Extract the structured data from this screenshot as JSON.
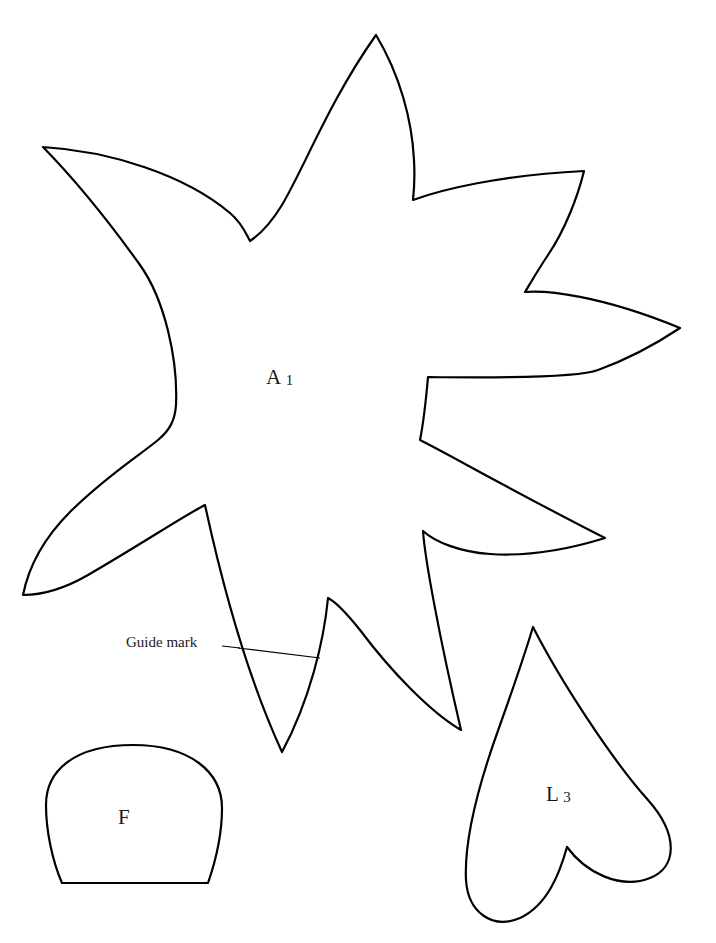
{
  "document": {
    "title": "Pattern Template Sheet",
    "background_color": "#ffffff",
    "stroke_color": "#000000",
    "page_width": 716,
    "page_height": 943
  },
  "pieces": [
    {
      "id": "piece-a1",
      "shape_name": "star-leaf-applique",
      "letter": "A",
      "numeral": "1",
      "label_text": "A 1",
      "description": "Large irregular star / leaf shaped applique piece with seven points"
    },
    {
      "id": "piece-f",
      "shape_name": "dome-flowerpot",
      "letter": "F",
      "numeral": "",
      "label_text": "F",
      "description": "Small dome shape with flat bottom edge"
    },
    {
      "id": "piece-l3",
      "shape_name": "heart-leaf",
      "letter": "L",
      "numeral": "3",
      "label_text": "L 3",
      "description": "Heart shaped leaf piece, tilted, point toward upper left"
    }
  ],
  "annotations": [
    {
      "id": "annotation-guide-mark",
      "text": "Guide mark",
      "target_piece": "piece-a1",
      "description": "Leader line pointing to a straight guide line drawn across the lower notch of piece A 1"
    }
  ]
}
